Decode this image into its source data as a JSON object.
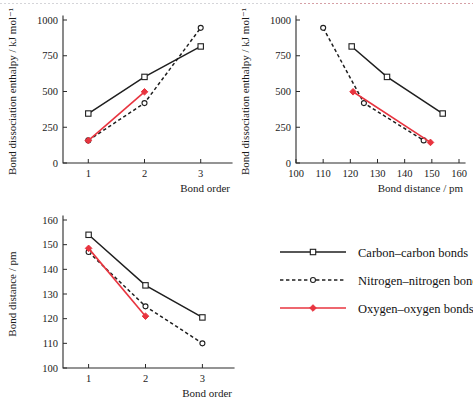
{
  "figure": {
    "title": "",
    "accent_red": "#e8343f",
    "ink": "#1f1f1f"
  },
  "legend": {
    "position": "bottom-right",
    "items": [
      {
        "label": "Carbon–carbon bonds",
        "marker": "square-open",
        "line": "solid",
        "color": "#1f1f1f",
        "name": "carbon-carbon"
      },
      {
        "label": "Nitrogen–nitrogen bonds",
        "marker": "circle-open",
        "line": "dashed",
        "color": "#1f1f1f",
        "name": "nitrogen-nitrogen"
      },
      {
        "label": "Oxygen–oxygen bonds",
        "marker": "diamond-filled",
        "line": "solid",
        "color": "#e8343f",
        "name": "oxygen-oxygen"
      }
    ]
  },
  "chart_data": [
    {
      "id": "enthalpy-vs-order",
      "type": "line",
      "title": "",
      "xlabel": "Bond order",
      "ylabel": "Bond dissociation enthalpy / kJ mol⁻¹",
      "xlim": [
        0.55,
        3.45
      ],
      "ylim": [
        0,
        1000
      ],
      "xticks": [
        1,
        2,
        3
      ],
      "yticks": [
        0,
        250,
        500,
        750,
        1000
      ],
      "grid": false,
      "series": [
        {
          "name": "Carbon–carbon bonds",
          "marker": "square-open",
          "line": "solid",
          "color": "#1f1f1f",
          "x": [
            1,
            2,
            3
          ],
          "y": [
            346,
            602,
            815
          ]
        },
        {
          "name": "Nitrogen–nitrogen bonds",
          "marker": "circle-open",
          "line": "dashed",
          "color": "#1f1f1f",
          "x": [
            1,
            2,
            3
          ],
          "y": [
            158,
            419,
            945
          ]
        },
        {
          "name": "Oxygen–oxygen bonds",
          "marker": "diamond-filled",
          "line": "solid",
          "color": "#e8343f",
          "x": [
            1,
            2
          ],
          "y": [
            157,
            498
          ]
        }
      ]
    },
    {
      "id": "enthalpy-vs-distance",
      "type": "line",
      "title": "",
      "xlabel": "Bond distance / pm",
      "ylabel": "Bond dissociation enthalpy / kJ mol⁻¹",
      "xlim": [
        100,
        160
      ],
      "ylim": [
        0,
        1000
      ],
      "xticks": [
        100,
        110,
        120,
        130,
        140,
        150,
        160
      ],
      "yticks": [
        0,
        250,
        500,
        750,
        1000
      ],
      "grid": false,
      "series": [
        {
          "name": "Carbon–carbon bonds",
          "marker": "square-open",
          "line": "solid",
          "color": "#1f1f1f",
          "x": [
            120.5,
            133.5,
            154
          ],
          "y": [
            815,
            602,
            346
          ]
        },
        {
          "name": "Nitrogen–nitrogen bonds",
          "marker": "circle-open",
          "line": "dashed",
          "color": "#1f1f1f",
          "x": [
            110,
            125,
            147
          ],
          "y": [
            945,
            419,
            158
          ]
        },
        {
          "name": "Oxygen–oxygen bonds",
          "marker": "diamond-filled",
          "line": "solid",
          "color": "#e8343f",
          "x": [
            121,
            149.5
          ],
          "y": [
            498,
            144
          ]
        }
      ]
    },
    {
      "id": "distance-vs-order",
      "type": "line",
      "title": "",
      "xlabel": "Bond order",
      "ylabel": "Bond distance / pm",
      "xlim": [
        0.55,
        3.45
      ],
      "ylim": [
        100,
        160
      ],
      "xticks": [
        1,
        2,
        3
      ],
      "yticks": [
        100,
        110,
        120,
        130,
        140,
        150,
        160
      ],
      "grid": false,
      "series": [
        {
          "name": "Carbon–carbon bonds",
          "marker": "square-open",
          "line": "solid",
          "color": "#1f1f1f",
          "x": [
            1,
            2,
            3
          ],
          "y": [
            154,
            133.5,
            120.5
          ]
        },
        {
          "name": "Nitrogen–nitrogen bonds",
          "marker": "circle-open",
          "line": "dashed",
          "color": "#1f1f1f",
          "x": [
            1,
            2,
            3
          ],
          "y": [
            147,
            125,
            110
          ]
        },
        {
          "name": "Oxygen–oxygen bonds",
          "marker": "diamond-filled",
          "line": "solid",
          "color": "#e8343f",
          "x": [
            1,
            2
          ],
          "y": [
            148.5,
            121
          ]
        }
      ]
    }
  ]
}
